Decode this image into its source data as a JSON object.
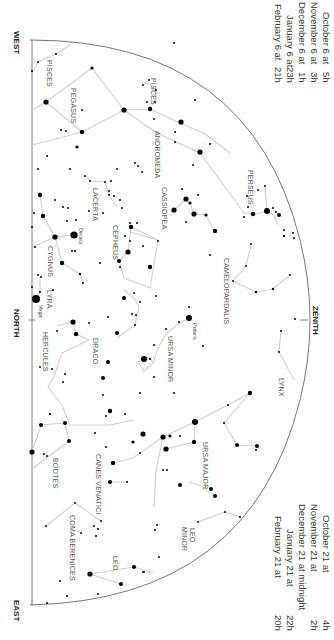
{
  "directions": {
    "west": "WEST",
    "north": "NORTH",
    "east": "EAST",
    "zenith": "ZENITH"
  },
  "times_top": {
    "rows": [
      {
        "date": "October 6 at",
        "hour": "5h"
      },
      {
        "date": "November 6 at",
        "hour": "3h"
      },
      {
        "date": "December 6 at",
        "hour": "1h"
      },
      {
        "date": "January 6 at",
        "hour": "23h"
      },
      {
        "date": "February 6 at",
        "hour": "21h"
      }
    ]
  },
  "times_bottom": {
    "rows": [
      {
        "date": "October 21 at",
        "hour": "4h"
      },
      {
        "date": "November 21 at",
        "hour": "2h"
      },
      {
        "date": "December 21 at midnight",
        "hour": ""
      },
      {
        "date": "January 21 at",
        "hour": "22h"
      },
      {
        "date": "February 21 at",
        "hour": "20h"
      }
    ]
  },
  "constellations": {
    "pisces": "PISCES",
    "pegasus": "PEGASUS",
    "andromeda": "ANDROMEDA",
    "pisces2": "PISCES",
    "perseus": "PERSEUS",
    "cassiopeia": "CASSIOPEA",
    "lacerta": "LACERTA",
    "cepheus": "CEPHEUS",
    "cygnus": "CYGNUS",
    "camelopardalis": "CAMELOPARDALIS",
    "lyra": "LYRA",
    "hercules": "HERCULES",
    "draco": "DRACO",
    "ursa_minor": "URSA MINOR",
    "lynx": "LYNX",
    "ursa_major": "URSA MAJOR",
    "canes_venatici": "CANES VENATICI",
    "bootes": "BOOTES",
    "coma_berenices": "COMA BERENICES",
    "leo_minor_1": "LEO",
    "leo_minor_2": "MINOR",
    "leo": "LEO"
  },
  "stars": {
    "deneb": "Deneb",
    "vega": "Vega",
    "polaris": "Polaris"
  },
  "colors": {
    "horizon": "#666666",
    "lines": "#cfcfcf",
    "stars": "#000000"
  }
}
